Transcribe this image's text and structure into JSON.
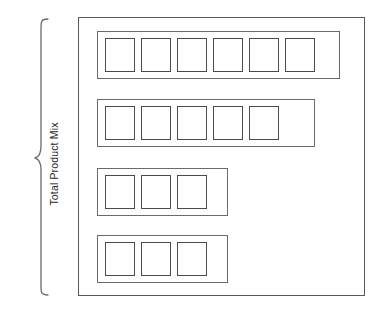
{
  "diagram": {
    "labels": {
      "outer_bracket": "Total Product Mix",
      "inner_bracket": "Individual product lines"
    },
    "outer_frame": {
      "name": "total-product-mix-frame",
      "x": 78,
      "y": 17,
      "width": 287,
      "height": 279
    },
    "brace": {
      "name": "total-product-mix-brace",
      "orientation": "vertical-left",
      "x": 40,
      "y_top": 20,
      "y_bottom": 293
    },
    "product_lines": [
      {
        "id": "product-line-1",
        "item_count": 6,
        "x": 97,
        "y": 31,
        "width": 243,
        "height": 48,
        "items": [
          "product-1-1",
          "product-1-2",
          "product-1-3",
          "product-1-4",
          "product-1-5",
          "product-1-6"
        ]
      },
      {
        "id": "product-line-2",
        "item_count": 5,
        "x": 97,
        "y": 99,
        "width": 218,
        "height": 48,
        "items": [
          "product-2-1",
          "product-2-2",
          "product-2-3",
          "product-2-4",
          "product-2-5"
        ]
      },
      {
        "id": "product-line-3",
        "item_count": 3,
        "x": 97,
        "y": 168,
        "width": 131,
        "height": 48,
        "items": [
          "product-3-1",
          "product-3-2",
          "product-3-3"
        ]
      },
      {
        "id": "product-line-4",
        "item_count": 4,
        "x": 97,
        "y": 235,
        "width": 131,
        "height": 48,
        "items": [
          "product-4-1",
          "product-4-2",
          "product-4-3"
        ]
      }
    ],
    "colors": {
      "stroke": "#5a5a5a",
      "box_stroke": "#4a4a4a",
      "text": "#2b2b2b",
      "background": "#ffffff"
    }
  }
}
